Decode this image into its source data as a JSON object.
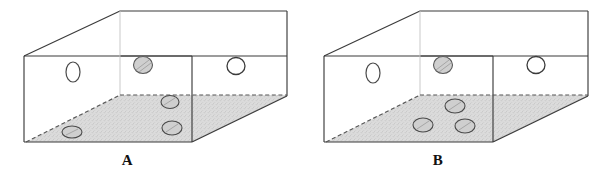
{
  "figure": {
    "title": "",
    "background_color": "#ffffff",
    "width": 611,
    "height": 178,
    "type": "line-diagram"
  },
  "style": {
    "outline_color": "#3b3b3b",
    "liquid_fill_color": "#d9d9d9",
    "liquid_surface_line": "dashed",
    "bubble_outline_color": "#4a4a4a",
    "bubble_open_fill": "#ffffff",
    "bubble_shaded_fill": "#cfcfcf",
    "label_color": "#111111"
  },
  "panels": [
    {
      "id": "a",
      "label": "A",
      "liquid_level_description": "lower-right wedge of liquid; dashed surface rises from front-bottom-left corner to the right",
      "bubbles": [
        {
          "name": "bubble-front-left-open",
          "fill": "open",
          "cx": 73,
          "cy": 72,
          "rx": 7,
          "ry": 10
        },
        {
          "name": "bubble-back-top-shaded",
          "fill": "shaded",
          "cx": 143,
          "cy": 65,
          "rx": 9.5,
          "ry": 8.5
        },
        {
          "name": "bubble-right-face-open",
          "fill": "open",
          "cx": 236,
          "cy": 66,
          "rx": 9,
          "ry": 8.5
        },
        {
          "name": "bubble-liquid-upper",
          "fill": "shaded",
          "cx": 170,
          "cy": 102,
          "rx": 9,
          "ry": 6.5
        },
        {
          "name": "bubble-liquid-lower",
          "fill": "shaded",
          "cx": 172,
          "cy": 128,
          "rx": 10,
          "ry": 7
        },
        {
          "name": "bubble-liquid-left",
          "fill": "shaded",
          "cx": 72,
          "cy": 132,
          "rx": 10,
          "ry": 6
        }
      ]
    },
    {
      "id": "b",
      "label": "B",
      "liquid_level_description": "lower-right wedge of liquid; dashed surface rises from front-bottom-left corner to the right",
      "bubbles": [
        {
          "name": "bubble-front-left-open",
          "fill": "open",
          "cx": 68,
          "cy": 73,
          "rx": 7,
          "ry": 10
        },
        {
          "name": "bubble-back-top-shaded",
          "fill": "shaded",
          "cx": 138,
          "cy": 65,
          "rx": 9.5,
          "ry": 8.5
        },
        {
          "name": "bubble-right-face-open",
          "fill": "open",
          "cx": 231,
          "cy": 65,
          "rx": 9,
          "ry": 8.5
        },
        {
          "name": "bubble-liquid-upper",
          "fill": "shaded",
          "cx": 150,
          "cy": 106,
          "rx": 10,
          "ry": 7
        },
        {
          "name": "bubble-liquid-lower-left",
          "fill": "shaded",
          "cx": 118,
          "cy": 125,
          "rx": 10,
          "ry": 7
        },
        {
          "name": "bubble-liquid-lower-right",
          "fill": "shaded",
          "cx": 160,
          "cy": 126,
          "rx": 10,
          "ry": 7
        }
      ]
    }
  ]
}
